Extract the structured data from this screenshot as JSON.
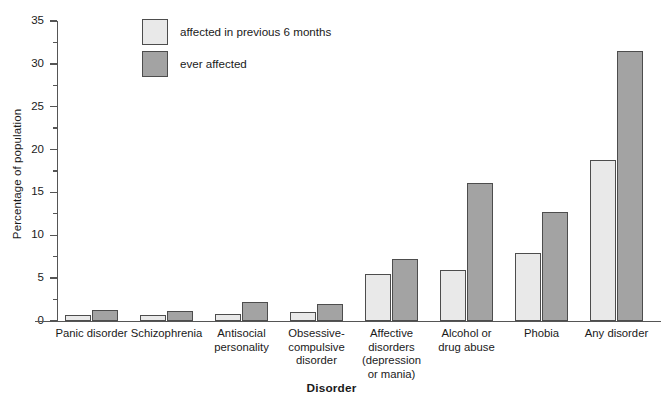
{
  "chart_data": {
    "type": "bar",
    "title": "",
    "xlabel": "Disorder",
    "ylabel": "Percentage of population",
    "ylim": [
      0,
      35
    ],
    "ytick_step": 5,
    "yminor_step": 2.5,
    "grid": false,
    "legend_position": "top-left-inside",
    "categories": [
      "Panic disorder",
      "Schizophrenia",
      "Antisocial\npersonality",
      "Obsessive-\ncompulsive\ndisorder",
      "Affective\ndisorders\n(depression\nor mania)",
      "Alcohol or\ndrug abuse",
      "Phobia",
      "Any disorder"
    ],
    "series": [
      {
        "name": "affected in previous 6 months",
        "color": "#e9e9e9",
        "values": [
          0.7,
          0.7,
          0.8,
          1.0,
          5.5,
          6.0,
          7.9,
          18.8
        ]
      },
      {
        "name": "ever affected",
        "color": "#a3a3a3",
        "values": [
          1.3,
          1.2,
          2.2,
          2.0,
          7.2,
          16.1,
          12.7,
          31.5
        ]
      }
    ],
    "ytick_labels": [
      "0",
      "5",
      "10",
      "15",
      "20",
      "25",
      "30",
      "35"
    ]
  },
  "legend": {
    "items": [
      {
        "label": "affected in previous 6 months",
        "swatch": "light"
      },
      {
        "label": "ever affected",
        "swatch": "dark"
      }
    ]
  },
  "colors": {
    "light_bar": "#e9e9e9",
    "dark_bar": "#a3a3a3",
    "bar_border": "#4d4d4d",
    "axis": "#555555",
    "background": "#ffffff",
    "text": "#1a1a1a"
  }
}
